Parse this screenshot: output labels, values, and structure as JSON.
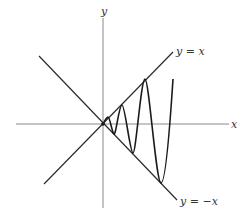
{
  "diagram": {
    "axes": {
      "x_label": "x",
      "y_label": "y"
    },
    "lines": [
      {
        "id": "upper-bound",
        "label": "y = x"
      },
      {
        "id": "lower-bound",
        "label": "y = −x"
      }
    ],
    "curve": {
      "description": "oscillating curve bounded between y = x and y = −x, amplitude growing with x, touching both lines alternately"
    },
    "colors": {
      "axis": "#8a8a8a",
      "lines": "#2b2b2b",
      "curve": "#1a1a1a",
      "background": "#ffffff"
    }
  }
}
